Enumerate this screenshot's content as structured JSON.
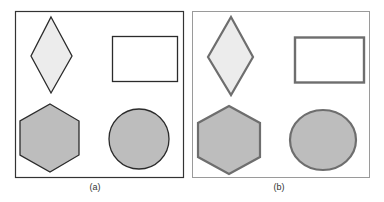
{
  "panels": [
    {
      "id": "a",
      "caption": "(a)",
      "border_color": "#333333",
      "stroke_color": "#2b2b2b",
      "shapes": [
        "diamond",
        "rectangle",
        "hexagon",
        "circle"
      ]
    },
    {
      "id": "b",
      "caption": "(b)",
      "border_color": "#9a9a9a",
      "stroke_color": "#6e6e6e",
      "shapes": [
        "diamond",
        "rectangle",
        "hexagon",
        "ellipse"
      ]
    }
  ],
  "colors": {
    "light_fill": "#ececec",
    "dark_fill": "#bdbdbd",
    "white_fill": "#ffffff"
  }
}
